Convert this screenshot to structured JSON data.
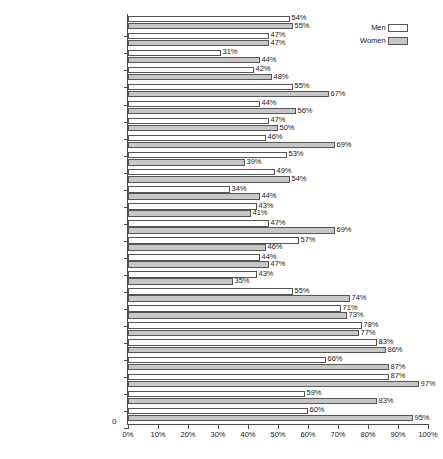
{
  "chart_data": {
    "type": "bar",
    "orientation": "horizontal",
    "title": "",
    "xlabel": "",
    "ylabel": "",
    "xlim": [
      0,
      100
    ],
    "xticks": [
      "0%",
      "10%",
      "20%",
      "30%",
      "40%",
      "50%",
      "60%",
      "70%",
      "80%",
      "90%",
      "100%"
    ],
    "xtick_values": [
      0,
      10,
      20,
      30,
      40,
      50,
      60,
      70,
      80,
      90,
      100
    ],
    "grid": false,
    "legend_position": "top-right",
    "legend": [
      "Men",
      "Women"
    ],
    "categories": [
      "Mexico ($5934)",
      "Venezuela ($4988)",
      "Chile ($4964)",
      "Costa Rica ($4185)",
      "Brazil ($3538)",
      "South Africa ($2910)",
      "Dominican Republic ($2359)",
      "El Salvador ($2115)",
      "Tunisia ($2036)",
      "Thailand ($2021)",
      "Colombia ($1980)",
      "Algeria ($1759)",
      "Guatemala ($1694)",
      "Egypt ($1554)",
      "Morocco ($1161)",
      "Syria ($1115)",
      "Bolivia ($1009)",
      "Philippines ($991)",
      "Indonesia ($728)",
      "India ($450)",
      "Guinea ($420)",
      "Benin ($362)",
      "Kenya ($347)",
      "Chad ($177)"
    ],
    "series": [
      {
        "name": "Men",
        "color": "#ffffff",
        "values": [
          54,
          47,
          31,
          42,
          55,
          44,
          47,
          46,
          53,
          49,
          34,
          43,
          47,
          57,
          44,
          43,
          55,
          71,
          78,
          83,
          66,
          87,
          59,
          60
        ],
        "labels": [
          "54%",
          "47%",
          "31%",
          "42%",
          "55%",
          "44%",
          "47%",
          "46%",
          "53%",
          "49%",
          "34%",
          "43%",
          "47%",
          "57%",
          "44%",
          "43%",
          "55%",
          "71%",
          "78%",
          "83%",
          "66%",
          "87%",
          "59%",
          "60%"
        ]
      },
      {
        "name": "Women",
        "color": "#c7c7c7",
        "values": [
          55,
          47,
          44,
          48,
          67,
          56,
          50,
          69,
          39,
          54,
          44,
          41,
          69,
          46,
          47,
          35,
          74,
          73,
          77,
          86,
          87,
          97,
          83,
          95
        ],
        "labels": [
          "55%",
          "47%",
          "44%",
          "48%",
          "67%",
          "56%",
          "50%",
          "69%",
          "39%",
          "54%",
          "44%",
          "41%",
          "69%",
          "46%",
          "47%",
          "35%",
          "74%",
          "73%",
          "77%",
          "86%",
          "87%",
          "97%",
          "83%",
          "95%"
        ]
      }
    ]
  },
  "axis": {
    "origin_label": "0"
  }
}
